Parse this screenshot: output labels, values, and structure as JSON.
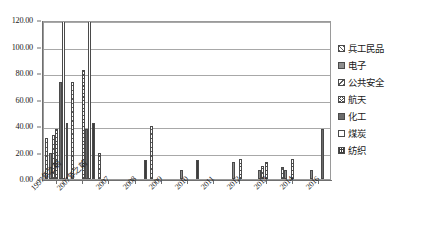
{
  "chart_data": {
    "type": "bar",
    "title": "",
    "xlabel": "",
    "ylabel": "",
    "ylim": [
      0,
      120
    ],
    "ytick_step": 20,
    "ytick_labels": [
      "0.00",
      "20.00",
      "40.00",
      "60.00",
      "80.00",
      "100.00",
      "120.00"
    ],
    "grid": "horizontal",
    "legend_position": "right",
    "clipped_note": "bars in the first two category groups extend beyond the 120.00 top of the plot",
    "categories": [
      "1997年之前",
      "2007年之前",
      "2007",
      "2008",
      "2009",
      "2010",
      "2011",
      "2012",
      "2013",
      "2014",
      "2016"
    ],
    "series": [
      {
        "name": "兵工民品",
        "pattern": "light-diagonal-hatch",
        "values": [
          31,
          73,
          20,
          0,
          40,
          0,
          0,
          0,
          0,
          9,
          0
        ]
      },
      {
        "name": "电子",
        "pattern": "solid-medium-gray",
        "values": [
          20,
          0,
          0,
          0,
          0,
          7,
          0,
          13,
          7,
          7,
          7
        ]
      },
      {
        "name": "公共安全",
        "pattern": "backslash-hatch",
        "values": [
          33,
          0,
          0,
          0,
          0,
          0,
          0,
          0,
          10,
          0,
          0
        ]
      },
      {
        "name": "航天",
        "pattern": "cross-hatch",
        "values": [
          38,
          82,
          0,
          0,
          0,
          0,
          0,
          15,
          13,
          15,
          0
        ]
      },
      {
        "name": "化工",
        "pattern": "solid-dark-gray",
        "values": [
          73,
          38,
          0,
          0,
          0,
          0,
          0,
          0,
          0,
          0,
          38
        ]
      },
      {
        "name": "煤炭",
        "pattern": "white-empty",
        "values": [
          120,
          120,
          0,
          0,
          0,
          0,
          0,
          0,
          0,
          0,
          0
        ]
      },
      {
        "name": "纺织",
        "pattern": "dense-grid",
        "values": [
          42,
          42,
          0,
          14,
          0,
          14,
          0,
          0,
          0,
          0,
          0
        ]
      }
    ]
  },
  "legend": {
    "items": [
      {
        "label": "兵工民品",
        "key": "binggong"
      },
      {
        "label": "电子",
        "key": "dianzi"
      },
      {
        "label": "公共安全",
        "key": "gonggong"
      },
      {
        "label": "航天",
        "key": "hangtian"
      },
      {
        "label": "化工",
        "key": "huagong"
      },
      {
        "label": "煤炭",
        "key": "meitan"
      },
      {
        "label": "纺织",
        "key": "fangzhi"
      }
    ]
  },
  "caption": {
    "text": ""
  }
}
